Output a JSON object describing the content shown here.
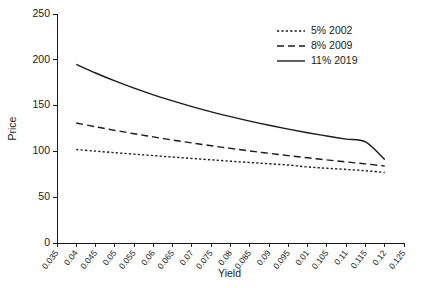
{
  "chart_data": {
    "type": "line",
    "title": "",
    "xlabel": "Yield",
    "ylabel": "Price",
    "xlim": [
      0.035,
      0.125
    ],
    "ylim": [
      0,
      250
    ],
    "grid": false,
    "legend_position": "top-right",
    "x_ticks": [
      "0.035",
      "0.04",
      "0.045",
      "0.05",
      "0.055",
      "0.06",
      "0.065",
      "0.07",
      "0.075",
      "0.08",
      "0.085",
      "0.09",
      "0.095",
      "0.01",
      "0.105",
      "0.11",
      "0.115",
      "0.12",
      "0.125"
    ],
    "x_tick_values": [
      0.035,
      0.04,
      0.045,
      0.05,
      0.055,
      0.06,
      0.065,
      0.07,
      0.075,
      0.08,
      0.085,
      0.09,
      0.095,
      0.1,
      0.105,
      0.11,
      0.115,
      0.12,
      0.125
    ],
    "y_ticks": [
      "0",
      "50",
      "100",
      "150",
      "200",
      "250"
    ],
    "y_tick_values": [
      0,
      50,
      100,
      150,
      200,
      250
    ],
    "x": [
      0.04,
      0.045,
      0.05,
      0.055,
      0.06,
      0.065,
      0.07,
      0.075,
      0.08,
      0.085,
      0.09,
      0.095,
      0.1,
      0.105,
      0.11,
      0.115,
      0.12
    ],
    "series": [
      {
        "name": "5% 2002",
        "style": "dotted",
        "color": "#1a1a1a",
        "values": [
          102.0,
          100.3,
          98.6,
          97.0,
          95.4,
          93.8,
          92.3,
          90.8,
          89.3,
          87.9,
          86.5,
          85.1,
          83.0,
          81.6,
          80.3,
          78.9,
          77.0
        ]
      },
      {
        "name": "8% 2009",
        "style": "dashed",
        "color": "#1a1a1a",
        "values": [
          131.0,
          126.9,
          123.0,
          119.3,
          115.8,
          112.4,
          109.2,
          106.2,
          103.3,
          100.5,
          97.9,
          95.4,
          93.0,
          90.7,
          88.5,
          86.4,
          84.0
        ]
      },
      {
        "name": "11% 2019",
        "style": "solid",
        "color": "#1a1a1a",
        "values": [
          195.0,
          185.6,
          177.0,
          169.1,
          161.8,
          155.1,
          148.9,
          143.2,
          137.9,
          133.0,
          128.5,
          124.3,
          120.4,
          116.8,
          113.4,
          110.3,
          91.0
        ]
      }
    ],
    "legend": [
      {
        "label": "5% 2002",
        "style": "dotted"
      },
      {
        "label": "8% 2009",
        "style": "dashed"
      },
      {
        "label": "11% 2019",
        "style": "solid"
      }
    ]
  }
}
